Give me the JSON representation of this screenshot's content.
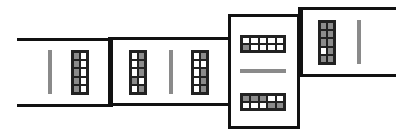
{
  "colors": {
    "line": "#111111",
    "filled_cell": "#8c8c8c",
    "empty_cell": "#ffffff",
    "bar": "#8a8a8a"
  },
  "segments": [
    {
      "id": "segment-1",
      "orientation": "horizontal",
      "items": [
        {
          "type": "bar",
          "orientation": "vertical"
        },
        {
          "type": "grid",
          "cols": 2,
          "rows": 5,
          "cells": [
            [
              "G",
              "W"
            ],
            [
              "G",
              "W"
            ],
            [
              "G",
              "W"
            ],
            [
              "G",
              "W"
            ],
            [
              "G",
              "W"
            ]
          ]
        }
      ]
    },
    {
      "id": "segment-2",
      "orientation": "horizontal",
      "items": [
        {
          "type": "grid",
          "cols": 2,
          "rows": 5,
          "cells": [
            [
              "W",
              "G"
            ],
            [
              "W",
              "G"
            ],
            [
              "W",
              "G"
            ],
            [
              "G",
              "W"
            ],
            [
              "W",
              "G"
            ]
          ]
        },
        {
          "type": "bar",
          "orientation": "vertical"
        },
        {
          "type": "grid",
          "cols": 2,
          "rows": 5,
          "cells": [
            [
              "W",
              "G"
            ],
            [
              "W",
              "W"
            ],
            [
              "W",
              "G"
            ],
            [
              "W",
              "G"
            ],
            [
              "W",
              "G"
            ]
          ]
        }
      ]
    },
    {
      "id": "segment-3",
      "orientation": "vertical",
      "items": [
        {
          "type": "grid",
          "cols": 5,
          "rows": 2,
          "cells": [
            [
              "W",
              "W",
              "W",
              "W",
              "W"
            ],
            [
              "G",
              "W",
              "W",
              "W",
              "W"
            ]
          ]
        },
        {
          "type": "bar",
          "orientation": "horizontal"
        },
        {
          "type": "grid",
          "cols": 5,
          "rows": 2,
          "cells": [
            [
              "G",
              "G",
              "G",
              "W",
              "W"
            ],
            [
              "W",
              "W",
              "W",
              "G",
              "G"
            ]
          ]
        }
      ]
    },
    {
      "id": "segment-4",
      "orientation": "horizontal",
      "items": [
        {
          "type": "grid",
          "cols": 2,
          "rows": 5,
          "cells": [
            [
              "G",
              "G"
            ],
            [
              "G",
              "G"
            ],
            [
              "G",
              "G"
            ],
            [
              "W",
              "G"
            ],
            [
              "G",
              "G"
            ]
          ]
        },
        {
          "type": "bar",
          "orientation": "vertical"
        }
      ]
    }
  ]
}
